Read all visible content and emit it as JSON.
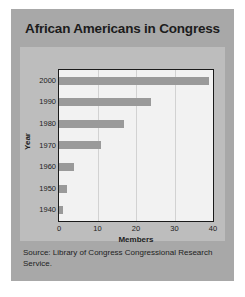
{
  "title": "African Americans in Congress",
  "source": "Source: Library of Congress Congressional Research Service.",
  "chart_data": {
    "type": "bar",
    "orientation": "horizontal",
    "title": "African Americans in Congress",
    "xlabel": "Members",
    "ylabel": "Year",
    "categories": [
      "1940",
      "1950",
      "1960",
      "1970",
      "1980",
      "1990",
      "2000"
    ],
    "values": [
      1,
      2,
      4,
      11,
      17,
      24,
      39
    ],
    "xlim": [
      0,
      40
    ],
    "xticks": [
      0,
      10,
      20,
      30,
      40
    ],
    "yticks": [
      "1940",
      "1950",
      "1960",
      "1970",
      "1980",
      "1990",
      "2000"
    ],
    "grid": "vertical",
    "legend": "none",
    "bar_color": "#9a9a9a",
    "plot_background": "#f2f2f2",
    "panel_background": "#bdbdbd",
    "card_background": "#a8a8a8",
    "axis_color": "#1a1a1a",
    "annotations": [
      "Source: Library of Congress Congressional Research Service."
    ]
  }
}
